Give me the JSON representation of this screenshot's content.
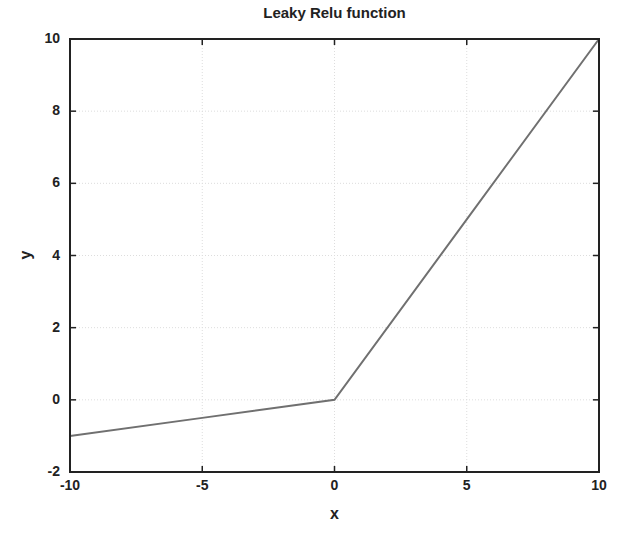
{
  "chart_data": {
    "type": "line",
    "title": "Leaky Relu function",
    "xlabel": "x",
    "ylabel": "y",
    "xlim": [
      -10,
      10
    ],
    "ylim": [
      -2,
      10
    ],
    "xticks": [
      -10,
      -5,
      0,
      5,
      10
    ],
    "yticks": [
      -2,
      0,
      2,
      4,
      6,
      8,
      10
    ],
    "grid": true,
    "legend": null,
    "series": [
      {
        "name": "Leaky ReLU",
        "x": [
          -10,
          -5,
          0,
          5,
          10
        ],
        "y": [
          -1,
          -0.5,
          0,
          5,
          10
        ],
        "color": "#707070"
      }
    ]
  },
  "labels": {
    "title": "Leaky Relu function",
    "xlabel": "x",
    "ylabel": "y",
    "xticks": [
      "-10",
      "-5",
      "0",
      "5",
      "10"
    ],
    "yticks": [
      "-2",
      "0",
      "2",
      "4",
      "6",
      "8",
      "10"
    ]
  },
  "colors": {
    "line": "#707070",
    "axes": "#222222",
    "grid": "#dddddd"
  }
}
